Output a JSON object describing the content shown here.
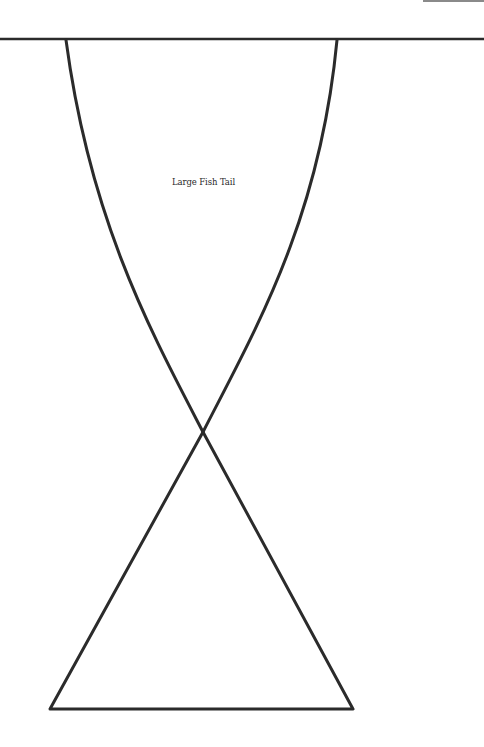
{
  "diagram": {
    "title": "Large Fish Tail",
    "stroke_color": "#2b2b2b",
    "stroke_width": 3,
    "top_line": {
      "y": 39,
      "x1": 0,
      "x2": 484
    },
    "left_curve": "M 66 40 C 90 220, 150 330, 203 432",
    "right_curve": "M 337 40 C 320 220, 255 330, 203 432",
    "triangle": "M 203 432 L 353 709 L 50 709 Z",
    "corner_bar_color": "#8a8a8a"
  }
}
